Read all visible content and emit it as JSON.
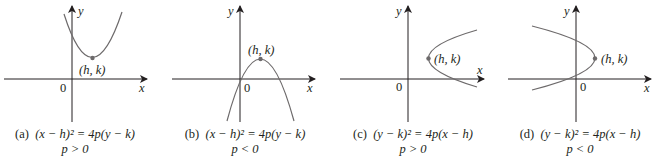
{
  "figure": {
    "panels": [
      {
        "id": "a",
        "tag": "(a)",
        "equation": "(x − h)² = 4p(y − k)",
        "condition": "p > 0",
        "vertex_label": "(h, k)",
        "origin_label": "0",
        "x_axis_label": "x",
        "y_axis_label": "y",
        "opens": "up"
      },
      {
        "id": "b",
        "tag": "(b)",
        "equation": "(x − h)² = 4p(y − k)",
        "condition": "p < 0",
        "vertex_label": "(h, k)",
        "origin_label": "0",
        "x_axis_label": "x",
        "y_axis_label": "y",
        "opens": "down"
      },
      {
        "id": "c",
        "tag": "(c)",
        "equation": "(y − k)² = 4p(x − h)",
        "condition": "p > 0",
        "vertex_label": "(h, k)",
        "origin_label": "0",
        "x_axis_label": "x",
        "y_axis_label": "y",
        "opens": "right"
      },
      {
        "id": "d",
        "tag": "(d)",
        "equation": "(y − k)² = 4p(x − h)",
        "condition": "p < 0",
        "vertex_label": "(h, k)",
        "origin_label": "0",
        "x_axis_label": "x",
        "y_axis_label": "y",
        "opens": "left"
      }
    ],
    "colors": {
      "ink": "#231f20",
      "curve": "#6d6a6b",
      "vertex_dot": "#6d6a6b"
    }
  }
}
